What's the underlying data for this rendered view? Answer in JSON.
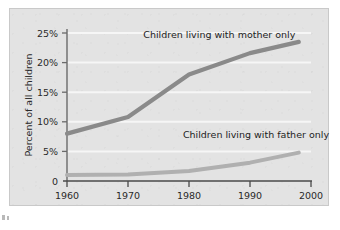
{
  "figure": {
    "background_color": "#e3e3e3",
    "page_color": "#ffffff",
    "frame_color": "#c9c9c9"
  },
  "chart_data": {
    "type": "line",
    "title": "",
    "xlabel": "",
    "ylabel": "Percent of all children",
    "x": [
      1960,
      1970,
      1980,
      1990,
      1998
    ],
    "xlim": [
      1960,
      2000
    ],
    "ylim": [
      0,
      25
    ],
    "xticks": [
      "1960",
      "1970",
      "1980",
      "1990",
      "2000"
    ],
    "xtick_values": [
      1960,
      1970,
      1980,
      1990,
      2000
    ],
    "yticks": [
      "0",
      "5%",
      "10%",
      "15%",
      "20%",
      "25%"
    ],
    "ytick_values": [
      0,
      5,
      10,
      15,
      20,
      25
    ],
    "grid": "horizontal",
    "legend": "annotations-inline",
    "series": [
      {
        "name": "Children living with mother only",
        "color": "#8a8a8a",
        "values": [
          8.0,
          10.8,
          18.0,
          21.6,
          23.5
        ]
      },
      {
        "name": "Children living with father only",
        "color": "#b0b0b0",
        "values": [
          1.0,
          1.1,
          1.7,
          3.1,
          4.8
        ]
      }
    ],
    "annotations": [
      {
        "text": "Children living with mother only",
        "x": 1972.5,
        "y": 24.1
      },
      {
        "text": "Children living with father only",
        "x": 1979.0,
        "y": 7.3
      }
    ]
  },
  "axis": {
    "y_axis_label": "Percent of all children",
    "y_tick_0": "0",
    "y_tick_5": "5%",
    "y_tick_10": "10%",
    "y_tick_15": "15%",
    "y_tick_20": "20%",
    "y_tick_25": "25%",
    "x_tick_1960": "1960",
    "x_tick_1970": "1970",
    "x_tick_1980": "1980",
    "x_tick_1990": "1990",
    "x_tick_2000": "2000"
  },
  "annotations": {
    "mother_label": "Children living with mother only",
    "father_label": "Children living with father only"
  },
  "colors": {
    "mother_line": "#8a8a8a",
    "father_line": "#b0b0b0",
    "gridline": "#f4f4f4",
    "axis": "#5c5c5c",
    "text": "#2a2a2a"
  }
}
